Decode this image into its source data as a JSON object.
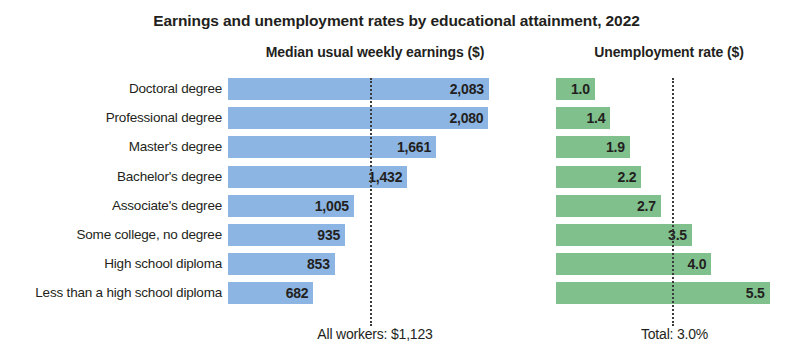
{
  "chart_data": {
    "type": "bar",
    "title": "Earnings and unemployment rates by educational attainment, 2022",
    "orientation": "horizontal",
    "grid": false,
    "legend": "none",
    "categories": [
      "Doctoral degree",
      "Professional degree",
      "Master's degree",
      "Bachelor's degree",
      "Associate's degree",
      "Some college, no degree",
      "High school diploma",
      "Less than a high school diploma"
    ],
    "panels": [
      {
        "id": "earnings",
        "subtitle": "Median usual weekly earnings ($)",
        "xlabel": "",
        "ylabel": "",
        "xlim": [
          0,
          2300
        ],
        "color": "#8cb5e4",
        "values": [
          2083,
          2080,
          1661,
          1432,
          1005,
          935,
          853,
          682
        ],
        "value_labels": [
          "2,083",
          "2,080",
          "1,661",
          "1,432",
          "1,005",
          "935",
          "853",
          "682"
        ],
        "reference_line_value": 1123,
        "footer": "All workers: $1,123"
      },
      {
        "id": "unemployment",
        "subtitle": "Unemployment rate ($)",
        "xlabel": "",
        "ylabel": "",
        "xlim": [
          0,
          6.1
        ],
        "color": "#7fc08d",
        "values": [
          1.0,
          1.4,
          1.9,
          2.2,
          2.7,
          3.5,
          4.0,
          5.5
        ],
        "value_labels": [
          "1.0",
          "1.4",
          "1.9",
          "2.2",
          "2.7",
          "3.5",
          "4.0",
          "5.5"
        ],
        "reference_line_value": 3.0,
        "footer": "Total: 3.0%"
      }
    ]
  },
  "colors": {
    "earnings_bar": "#8cb5e4",
    "unemployment_bar": "#7fc08d",
    "text": "#231f20",
    "reference_line": "#3b3b3b",
    "background": "#ffffff"
  }
}
